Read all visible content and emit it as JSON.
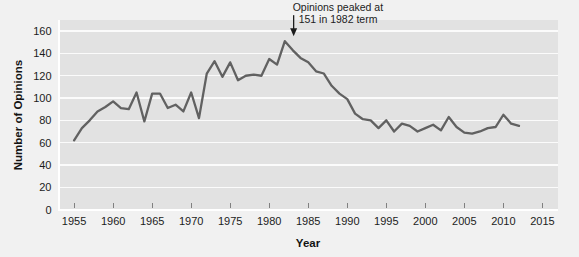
{
  "chart_data": {
    "type": "line",
    "title": "",
    "xlabel": "Year",
    "ylabel": "Number of Opinions",
    "xlim": [
      1953,
      2017
    ],
    "ylim": [
      0,
      170
    ],
    "grid": true,
    "legend": "none",
    "x_ticks": [
      1955,
      1960,
      1965,
      1970,
      1975,
      1980,
      1985,
      1990,
      1995,
      2000,
      2005,
      2010,
      2015
    ],
    "y_ticks": [
      0,
      20,
      40,
      60,
      80,
      100,
      120,
      140,
      160
    ],
    "annotations": [
      {
        "name": "peak-callout",
        "line1": "Opinions peaked at",
        "line2": "151 in 1982 term",
        "target_x": 1983,
        "target_y": 151
      }
    ],
    "series": [
      {
        "name": "Number of Opinions",
        "color": "#616161",
        "x": [
          1955,
          1956,
          1957,
          1958,
          1959,
          1960,
          1961,
          1962,
          1963,
          1964,
          1965,
          1966,
          1967,
          1968,
          1969,
          1970,
          1971,
          1972,
          1973,
          1974,
          1975,
          1976,
          1977,
          1978,
          1979,
          1980,
          1981,
          1982,
          1983,
          1984,
          1985,
          1986,
          1987,
          1988,
          1989,
          1990,
          1991,
          1992,
          1993,
          1994,
          1995,
          1996,
          1997,
          1998,
          1999,
          2000,
          2001,
          2002,
          2003,
          2004,
          2005,
          2006,
          2007,
          2008,
          2009,
          2010,
          2011,
          2012
        ],
        "values": [
          62,
          73,
          80,
          88,
          92,
          97,
          91,
          90,
          105,
          79,
          104,
          104,
          91,
          94,
          88,
          105,
          82,
          122,
          133,
          119,
          132,
          116,
          120,
          121,
          120,
          135,
          130,
          151,
          143,
          136,
          132,
          124,
          122,
          111,
          104,
          99,
          86,
          81,
          80,
          73,
          80,
          70,
          77,
          75,
          70,
          73,
          76,
          71,
          83,
          74,
          69,
          68,
          70,
          73,
          74,
          85,
          77,
          75
        ]
      }
    ]
  },
  "axis": {
    "y_title": "Number of Opinions",
    "x_title": "Year"
  }
}
